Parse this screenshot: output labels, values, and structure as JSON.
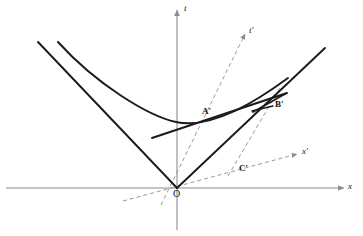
{
  "figure": {
    "kind": "minkowski-spacetime-diagram",
    "title": "",
    "background": "#ffffff",
    "colors": {
      "axis": "#8c8c8c",
      "curve": "#1a1a1a",
      "worldline": "#1a1a1a",
      "primed_axis": "#9a9a9a",
      "label": "#111111"
    }
  },
  "axes": {
    "x": {
      "label": "x",
      "label_pos": {
        "x": 349,
        "y": 184
      },
      "line": {
        "x1": 6,
        "y1": 188,
        "x2": 344,
        "y2": 188
      },
      "arrow": true
    },
    "t": {
      "label": "t",
      "label_pos": {
        "x": 184,
        "y": 6
      },
      "line": {
        "x1": 177,
        "y1": 230,
        "x2": 177,
        "y2": 10
      },
      "arrow": true
    },
    "x_prime": {
      "label": "x'",
      "label_pos": {
        "x": 303,
        "y": 149
      },
      "line": {
        "x1": 123,
        "y1": 201,
        "x2": 297,
        "y2": 154
      },
      "dashed": true,
      "arrow": true
    },
    "t_prime": {
      "label": "t'",
      "label_pos": {
        "x": 250,
        "y": 27
      },
      "line": {
        "x1": 161,
        "y1": 205,
        "x2": 245,
        "y2": 34
      },
      "dashed": true,
      "arrow": true
    }
  },
  "points": [
    {
      "name": "O",
      "label": "O",
      "x": 177,
      "y": 188,
      "label_x": 174,
      "label_y": 190
    },
    {
      "name": "A'",
      "label": "A'",
      "x": 213,
      "y": 121,
      "label_x": 203,
      "label_y": 108
    },
    {
      "name": "B'",
      "label": "B'",
      "x": 272,
      "y": 107,
      "label_x": 275,
      "label_y": 101
    },
    {
      "name": "C'",
      "label": "C'",
      "x": 245,
      "y": 168,
      "label_x": 240,
      "label_y": 166
    }
  ],
  "curves": {
    "hyperbola": {
      "description": "invariant hyperbola t^2 - x^2 = const",
      "vertex": {
        "x": 176,
        "y": 122
      },
      "left_end": {
        "x": 58,
        "y": 42
      },
      "right_end": {
        "x": 288,
        "y": 78
      }
    },
    "lightcone_left": {
      "x1": 38,
      "y1": 42,
      "x2": 177,
      "y2": 188
    },
    "lightcone_right": {
      "x1": 177,
      "y1": 188,
      "x2": 325,
      "y2": 48
    },
    "tangent_at_A": {
      "x1": 152,
      "y1": 138,
      "x2": 287,
      "y2": 93
    },
    "chord_from_B": {
      "x1": 272,
      "y1": 107,
      "x2": 285,
      "y2": 94
    },
    "dashed_through_B": {
      "x1": 228,
      "y1": 176,
      "x2": 281,
      "y2": 86
    }
  }
}
